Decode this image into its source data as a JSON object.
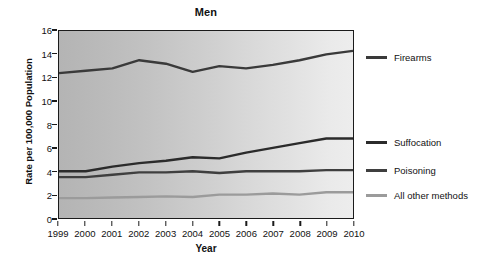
{
  "chart_data": {
    "type": "line",
    "title": "Men",
    "xlabel": "Year",
    "ylabel": "Rate per 100,000 Population",
    "x": [
      1999,
      2000,
      2001,
      2002,
      2003,
      2004,
      2005,
      2006,
      2007,
      2008,
      2009,
      2010
    ],
    "categories": [
      "1999",
      "2000",
      "2001",
      "2002",
      "2003",
      "2004",
      "2005",
      "2006",
      "2007",
      "2008",
      "2009",
      "2010"
    ],
    "xlim": [
      1999,
      2010
    ],
    "ylim": [
      0,
      16
    ],
    "yticks": [
      0,
      2,
      4,
      6,
      8,
      10,
      12,
      14,
      16
    ],
    "ytick_labels": [
      "0",
      "2",
      "4",
      "6",
      "8",
      "10",
      "12",
      "14",
      "16"
    ],
    "grid": false,
    "legend_position": "right",
    "series": [
      {
        "name": "Firearms",
        "color": "#3a3a3a",
        "width": 2.4,
        "values": [
          12.4,
          12.6,
          12.8,
          13.5,
          13.2,
          12.5,
          13.0,
          12.8,
          13.1,
          13.5,
          14.0,
          14.3
        ]
      },
      {
        "name": "Suffocation",
        "color": "#2b2b2b",
        "width": 2.4,
        "values": [
          4.0,
          4.0,
          4.4,
          4.7,
          4.9,
          5.2,
          5.1,
          5.6,
          6.0,
          6.4,
          6.8,
          6.8
        ]
      },
      {
        "name": "Poisoning",
        "color": "#3f3f3f",
        "width": 2.4,
        "values": [
          3.5,
          3.5,
          3.7,
          3.9,
          3.9,
          4.0,
          3.85,
          4.0,
          4.0,
          4.0,
          4.1,
          4.1
        ]
      },
      {
        "name": "All other methods",
        "color": "#9b9b9b",
        "width": 2.4,
        "values": [
          1.7,
          1.7,
          1.75,
          1.8,
          1.85,
          1.8,
          2.0,
          2.0,
          2.1,
          2.0,
          2.2,
          2.2
        ]
      }
    ],
    "legend_entries": [
      {
        "label": "Firearms",
        "color": "#3a3a3a",
        "y_frac": 0.148
      },
      {
        "label": "Suffocation",
        "color": "#2b2b2b",
        "y_frac": 0.593
      },
      {
        "label": "Poisoning",
        "color": "#3f3f3f",
        "y_frac": 0.745
      },
      {
        "label": "All other methods",
        "color": "#9b9b9b",
        "y_frac": 0.878
      }
    ],
    "plot_background": {
      "gradient_from": "#b4b4b4",
      "gradient_to": "#ededed"
    },
    "axis_color": "#1b1b1b"
  }
}
